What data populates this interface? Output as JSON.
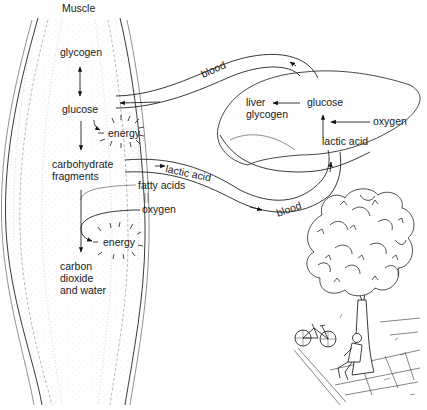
{
  "diagram": {
    "title": "Muscle",
    "muscle": {
      "label": "Muscle",
      "nodes": {
        "glycogen": "glycogen",
        "glucose": "glucose",
        "energy_top": "energy",
        "carbohydrate_line1": "carbohydrate",
        "carbohydrate_line2": "fragments",
        "fatty_acids": "fatty acids",
        "oxygen": "oxygen",
        "energy_bottom": "energy",
        "end_line1": "carbon",
        "end_line2": "dioxide",
        "end_line3": "and water"
      }
    },
    "liver": {
      "nodes": {
        "liver_glycogen_line1": "liver",
        "liver_glycogen_line2": "glycogen",
        "glucose": "glucose",
        "oxygen": "oxygen",
        "lactic_acid": "lactic acid"
      }
    },
    "vessels": {
      "top_blood": "blood",
      "bottom_lactic": "lactic acid",
      "bottom_blood": "blood"
    },
    "edges": [
      {
        "from": "glycogen",
        "to": "glucose",
        "type": "bidirectional"
      },
      {
        "from": "glucose",
        "to": "carbohydrate fragments"
      },
      {
        "from": "glucose",
        "to": "energy"
      },
      {
        "from": "carbohydrate fragments",
        "to": "lactic acid (blood)"
      },
      {
        "from": "lactic acid",
        "to": "liver glucose"
      },
      {
        "from": "oxygen",
        "to": "liver pathway"
      },
      {
        "from": "liver glucose",
        "to": "liver glycogen"
      },
      {
        "from": "liver glucose",
        "to": "blood",
        "to_node": "muscle glucose"
      },
      {
        "from": "carbohydrate fragments",
        "to": "carbon dioxide and water"
      },
      {
        "from": "fatty acids + oxygen",
        "to": "energy"
      }
    ],
    "illustration": "person-resting-under-tree-with-bicycle"
  }
}
